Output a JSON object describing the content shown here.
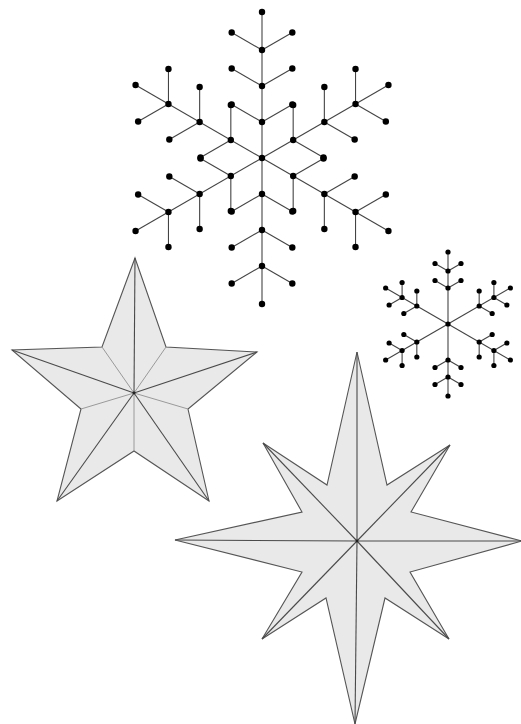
{
  "colors": {
    "background": "#ffffff",
    "star_fill": "#e9e9e9",
    "star_outline": "#555555",
    "ridge_main": "#4a4a4a",
    "ridge_soft": "#9a9a9a",
    "snowflake_line": "#444444",
    "snowflake_dot": "#000000"
  },
  "snowflakes": [
    {
      "name": "large-snowflake",
      "center": [
        262,
        158
      ],
      "arm_angles_deg": [
        90,
        30,
        -30,
        -90,
        -150,
        150
      ],
      "node_distances": [
        36,
        72,
        108
      ],
      "branch_length": 35,
      "branch_angle_deg": 60,
      "tip_distance": 146,
      "dot_radius": 3.2
    },
    {
      "name": "small-snowflake",
      "center": [
        448,
        324
      ],
      "arm_angles_deg": [
        90,
        30,
        -30,
        -90,
        -150,
        150
      ],
      "node_distances": [
        36,
        53
      ],
      "branch_length": 15,
      "branch_angle_deg": 60,
      "tip_distance": 72,
      "dot_radius": 2.6
    }
  ],
  "stars": [
    {
      "name": "five-point-star",
      "center": [
        134,
        393
      ],
      "outline": [
        [
          135,
          258
        ],
        [
          166,
          347
        ],
        [
          257,
          352
        ],
        [
          188,
          409
        ],
        [
          209,
          501
        ],
        [
          134,
          451
        ],
        [
          57,
          501
        ],
        [
          81,
          409
        ],
        [
          12,
          350
        ],
        [
          102,
          347
        ]
      ],
      "main_ridges_to": [
        [
          135,
          258
        ],
        [
          257,
          352
        ],
        [
          209,
          501
        ],
        [
          57,
          501
        ],
        [
          12,
          350
        ]
      ],
      "soft_ridges_to": [
        [
          166,
          347
        ],
        [
          188,
          409
        ],
        [
          134,
          451
        ],
        [
          81,
          409
        ],
        [
          102,
          347
        ]
      ]
    },
    {
      "name": "eight-point-compass-star",
      "center": [
        357,
        541
      ],
      "outline": [
        [
          357,
          352
        ],
        [
          387,
          485
        ],
        [
          450,
          445
        ],
        [
          411,
          512
        ],
        [
          522,
          541
        ],
        [
          410,
          572
        ],
        [
          449,
          639
        ],
        [
          385,
          598
        ],
        [
          355,
          724
        ],
        [
          326,
          598
        ],
        [
          262,
          639
        ],
        [
          302,
          572
        ],
        [
          175,
          540
        ],
        [
          302,
          512
        ],
        [
          263,
          443
        ],
        [
          327,
          485
        ]
      ],
      "main_ridges_to": [
        [
          357,
          352
        ],
        [
          450,
          445
        ],
        [
          522,
          541
        ],
        [
          449,
          639
        ],
        [
          355,
          724
        ],
        [
          262,
          639
        ],
        [
          175,
          540
        ],
        [
          263,
          443
        ]
      ],
      "soft_ridges_to": []
    }
  ]
}
